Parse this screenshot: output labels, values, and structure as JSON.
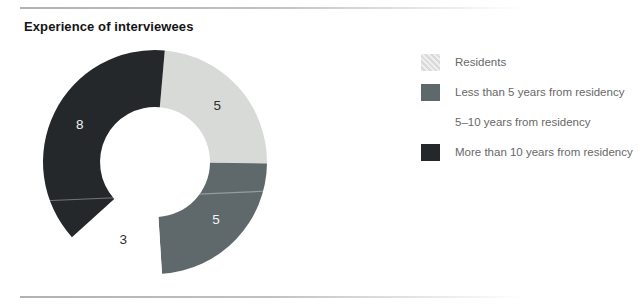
{
  "figure": {
    "title": "Experience of interviewees"
  },
  "chart_data": {
    "type": "pie",
    "subtype": "donut",
    "title": "Experience of interviewees",
    "start_angle_deg": 5,
    "total": 21,
    "legend_position": "right",
    "segments": [
      {
        "label": "Residents",
        "value": 5,
        "data_label": "5",
        "color": "#d8dad7",
        "data_label_color": "#2f2f2f"
      },
      {
        "label": "Less than 5 years from residency",
        "value": 5,
        "data_label": "5",
        "color": "#5f696c",
        "data_label_color": "#f3f3f3"
      },
      {
        "label": "5–10 years from residency",
        "value": 3,
        "data_label": "3",
        "color": "#ffffff",
        "data_label_color": "#2f2f2f"
      },
      {
        "label": "More than 10 years from residency",
        "value": 8,
        "data_label": "8",
        "color": "#24282b",
        "data_label_color": "#f3f3f3"
      }
    ]
  },
  "legend": {
    "items": [
      {
        "label": "Residents",
        "color": "#d8dad7",
        "hatched": true
      },
      {
        "label": "Less than 5 years from residency",
        "color": "#5f696c",
        "hatched": false
      },
      {
        "label": "5–10 years from residency",
        "color": "#ffffff",
        "hatched": false
      },
      {
        "label": "More than 10 years from residency",
        "color": "#24282b",
        "hatched": false
      }
    ]
  },
  "colors": {
    "residents": "#d8dad7",
    "less_than_5_years": "#5f696c",
    "five_to_ten_years": "#ffffff",
    "more_than_10_years": "#24282b",
    "legend_text": "#686868",
    "title_text": "#141414",
    "rule_line": "#a4a4a4"
  }
}
